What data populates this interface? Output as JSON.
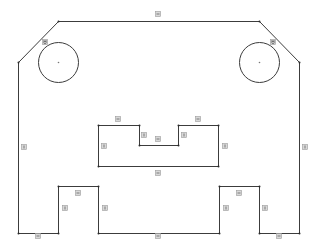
{
  "sketch": {
    "stroke_color": "#3c3c3c",
    "background": "#ffffff",
    "badge_fill": "#d8d8d8",
    "outline": {
      "points": [
        [
          58,
          21
        ],
        [
          259,
          21
        ],
        [
          299,
          62
        ],
        [
          299,
          233
        ],
        [
          259,
          233
        ],
        [
          259,
          186
        ],
        [
          219,
          186
        ],
        [
          219,
          233
        ],
        [
          98,
          233
        ],
        [
          98,
          186
        ],
        [
          58,
          186
        ],
        [
          58,
          233
        ],
        [
          18,
          233
        ],
        [
          18,
          62
        ]
      ]
    },
    "slot": {
      "points": [
        [
          98,
          125
        ],
        [
          139,
          125
        ],
        [
          139,
          145
        ],
        [
          178,
          145
        ],
        [
          178,
          125
        ],
        [
          218,
          125
        ],
        [
          218,
          166
        ],
        [
          98,
          166
        ]
      ]
    },
    "circles": [
      {
        "name": "hole-left",
        "cx": 58,
        "cy": 62,
        "r": 20
      },
      {
        "name": "hole-right",
        "cx": 259,
        "cy": 62,
        "r": 20
      }
    ],
    "constraints": [
      {
        "type": "horizontal",
        "x": 158,
        "y": 14
      },
      {
        "type": "tangent",
        "x": 45,
        "y": 42
      },
      {
        "type": "tangent",
        "x": 273,
        "y": 42
      },
      {
        "type": "vertical",
        "x": 24,
        "y": 147
      },
      {
        "type": "vertical",
        "x": 305,
        "y": 147
      },
      {
        "type": "horizontal",
        "x": 118,
        "y": 119
      },
      {
        "type": "horizontal",
        "x": 198,
        "y": 119
      },
      {
        "type": "vertical",
        "x": 144,
        "y": 135
      },
      {
        "type": "vertical",
        "x": 184,
        "y": 135
      },
      {
        "type": "horizontal",
        "x": 158,
        "y": 139
      },
      {
        "type": "vertical",
        "x": 104,
        "y": 146
      },
      {
        "type": "vertical",
        "x": 225,
        "y": 146
      },
      {
        "type": "horizontal",
        "x": 158,
        "y": 173
      },
      {
        "type": "horizontal",
        "x": 78,
        "y": 193
      },
      {
        "type": "vertical",
        "x": 65,
        "y": 208
      },
      {
        "type": "vertical",
        "x": 105,
        "y": 208
      },
      {
        "type": "horizontal",
        "x": 38,
        "y": 236
      },
      {
        "type": "horizontal",
        "x": 158,
        "y": 236
      },
      {
        "type": "horizontal",
        "x": 239,
        "y": 193
      },
      {
        "type": "vertical",
        "x": 226,
        "y": 208
      },
      {
        "type": "vertical",
        "x": 265,
        "y": 208
      },
      {
        "type": "horizontal",
        "x": 279,
        "y": 236
      }
    ]
  }
}
